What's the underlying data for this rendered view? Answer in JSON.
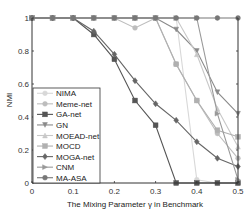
{
  "chart_data": {
    "type": "line",
    "title": "",
    "xlabel": "The Mixing Parameter γ in Benchmark",
    "ylabel": "NMI",
    "xlim": [
      0,
      0.5
    ],
    "ylim": [
      0,
      1
    ],
    "xticks": [
      "0",
      "0.1",
      "0.2",
      "0.3",
      "0.4",
      "0.5"
    ],
    "yticks": [
      "0",
      "0.2",
      "0.4",
      "0.6",
      "0.8",
      "1"
    ],
    "grid": false,
    "legend_position": "lower left",
    "x": [
      0,
      0.05,
      0.1,
      0.15,
      0.2,
      0.25,
      0.3,
      0.35,
      0.4,
      0.45,
      0.5
    ],
    "series": [
      {
        "name": "NIMA",
        "color": "#d8d8d8",
        "marker": "circle",
        "values": [
          1,
          1,
          1,
          1,
          1,
          1,
          1,
          1,
          0.02,
          0,
          0
        ]
      },
      {
        "name": "Meme-net",
        "color": "#bdbdbd",
        "marker": "circle",
        "values": [
          1,
          1,
          1,
          1,
          1,
          0.94,
          1,
          0.72,
          0.5,
          0.3,
          0.15
        ]
      },
      {
        "name": "GA-net",
        "color": "#555555",
        "marker": "square",
        "values": [
          1,
          1,
          1,
          0.9,
          0.75,
          0.5,
          0.35,
          0,
          0,
          0,
          0
        ]
      },
      {
        "name": "GN",
        "color": "#8a8a8a",
        "marker": "triangle-down",
        "values": [
          1,
          1,
          1,
          1,
          1,
          1,
          1,
          0.93,
          0.8,
          0.55,
          0.42
        ]
      },
      {
        "name": "MOEAD-net",
        "color": "#c8c8c8",
        "marker": "triangle-up",
        "values": [
          1,
          1,
          1,
          1,
          1,
          1,
          1,
          1,
          0.78,
          0.45,
          0.22
        ]
      },
      {
        "name": "MOCD",
        "color": "#b0b0b0",
        "marker": "square",
        "values": [
          1,
          1,
          1,
          1,
          1,
          1,
          1,
          0.72,
          0.5,
          0.32,
          0.28
        ]
      },
      {
        "name": "MOGA-net",
        "color": "#666666",
        "marker": "diamond",
        "values": [
          1,
          1,
          1,
          0.92,
          0.78,
          0.62,
          0.48,
          0.38,
          0.25,
          0.15,
          0.1
        ]
      },
      {
        "name": "CNM",
        "color": "#999999",
        "marker": "triangle-right",
        "values": [
          1,
          1,
          1,
          1,
          1,
          1,
          1,
          1,
          1,
          0.42,
          0.02
        ]
      },
      {
        "name": "MA-ASA",
        "color": "#777777",
        "marker": "circle",
        "values": [
          1,
          1,
          1,
          1,
          1,
          1,
          1,
          1,
          1,
          1,
          1
        ]
      }
    ]
  }
}
